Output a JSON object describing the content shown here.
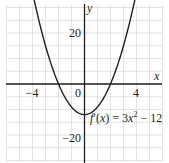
{
  "chart_data": {
    "type": "line",
    "title": "",
    "xlabel": "x",
    "ylabel": "y",
    "xlim": [
      -6,
      6
    ],
    "ylim": [
      -30.5,
      31
    ],
    "grid": true,
    "x_grid_step": 1,
    "y_grid_step": 5,
    "x_ticks": [
      {
        "value": -4,
        "label": "−4"
      },
      {
        "value": 0,
        "label": "0"
      },
      {
        "value": 4,
        "label": "4"
      }
    ],
    "y_ticks": [
      {
        "value": 20,
        "label": "20"
      },
      {
        "value": -20,
        "label": "−20"
      }
    ],
    "series": [
      {
        "name": "f'(x) = 3x^2 − 12",
        "expression": "3*x^2 - 12",
        "x": [
          -4,
          -3,
          -2,
          -1,
          0,
          1,
          2,
          3,
          4
        ],
        "values": [
          36,
          15,
          0,
          -9,
          -12,
          -9,
          0,
          15,
          36
        ],
        "color": "#231f20"
      }
    ],
    "annotations": [
      {
        "text_parts": [
          "f",
          "′(",
          "x",
          ") = 3",
          "x",
          "2",
          " − 12"
        ],
        "plain": "f′(x) = 3x² − 12",
        "anchor_x": 0.3,
        "anchor_y": -18
      }
    ]
  },
  "labels": {
    "x_axis": "x",
    "y_axis": "y",
    "origin": "0",
    "tick_neg4": "−4",
    "tick_pos4": "4",
    "tick_pos20": "20",
    "tick_neg20": "−20",
    "eq_f": "f",
    "eq_prime": "′(",
    "eq_x1": "x",
    "eq_mid": ") = 3",
    "eq_x2": "x",
    "eq_sup": "2",
    "eq_tail": " − 12"
  },
  "colors": {
    "grid": "#dcdcdc",
    "axis": "#231f20",
    "curve": "#231f20",
    "background": "#ffffff"
  }
}
